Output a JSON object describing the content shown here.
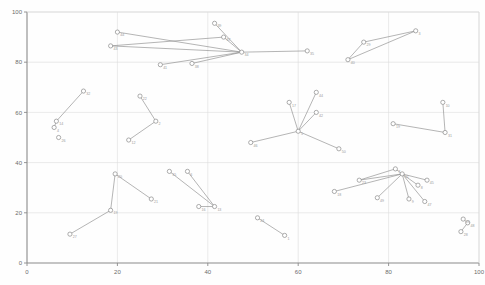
{
  "chart_data": {
    "type": "scatter",
    "title": "",
    "xlabel": "",
    "ylabel": "",
    "xlim": [
      0,
      100
    ],
    "ylim": [
      0,
      100
    ],
    "grid": true,
    "legend": "none",
    "xticks": [
      "0",
      "20",
      "40",
      "60",
      "80",
      "100"
    ],
    "yticks": [
      "0",
      "20",
      "40",
      "60",
      "80",
      "100"
    ],
    "xtick_values": [
      0,
      20,
      40,
      60,
      80,
      100
    ],
    "ytick_values": [
      0,
      20,
      40,
      60,
      80,
      100
    ],
    "node_color": "#ffffff",
    "node_stroke": "#8a8a8a",
    "edge_color": "#8d8d8d",
    "axis_color": "#8a8a8a",
    "grid_color": "#dcdcdc",
    "nodes": [
      {
        "id": "44",
        "label": "44",
        "x": 20.0,
        "y": 92.0
      },
      {
        "id": "43",
        "label": "43",
        "x": 18.5,
        "y": 86.5
      },
      {
        "id": "41",
        "label": "41",
        "x": 29.5,
        "y": 79.0
      },
      {
        "id": "38",
        "label": "38",
        "x": 36.5,
        "y": 79.5
      },
      {
        "id": "34",
        "label": "34",
        "x": 47.5,
        "y": 84.0
      },
      {
        "id": "39",
        "label": "39",
        "x": 41.5,
        "y": 95.5
      },
      {
        "id": "37",
        "label": "37",
        "x": 43.5,
        "y": 90.0
      },
      {
        "id": "35",
        "label": "35",
        "x": 62.0,
        "y": 84.5
      },
      {
        "id": "3",
        "label": "3",
        "x": 86.0,
        "y": 92.5
      },
      {
        "id": "29",
        "label": "29",
        "x": 74.5,
        "y": 88.0
      },
      {
        "id": "40",
        "label": "40",
        "x": 71.0,
        "y": 81.0
      },
      {
        "id": "32",
        "label": "32",
        "x": 12.5,
        "y": 68.5
      },
      {
        "id": "14",
        "label": "14",
        "x": 6.5,
        "y": 56.5
      },
      {
        "id": "4",
        "label": "4",
        "x": 6.0,
        "y": 54.0
      },
      {
        "id": "26",
        "label": "26",
        "x": 7.0,
        "y": 50.0
      },
      {
        "id": "22",
        "label": "22",
        "x": 25.0,
        "y": 66.5
      },
      {
        "id": "2",
        "label": "2",
        "x": 28.5,
        "y": 56.5
      },
      {
        "id": "12",
        "label": "12",
        "x": 22.5,
        "y": 49.0
      },
      {
        "id": "44b",
        "label": "44",
        "x": 64.0,
        "y": 68.0
      },
      {
        "id": "42",
        "label": "42",
        "x": 64.0,
        "y": 60.0
      },
      {
        "id": "17",
        "label": "17",
        "x": 58.0,
        "y": 64.0
      },
      {
        "id": "5",
        "label": "5",
        "x": 60.0,
        "y": 52.5
      },
      {
        "id": "46",
        "label": "46",
        "x": 49.5,
        "y": 48.0
      },
      {
        "id": "50",
        "label": "50",
        "x": 69.0,
        "y": 45.5
      },
      {
        "id": "19",
        "label": "19",
        "x": 81.0,
        "y": 55.5
      },
      {
        "id": "31",
        "label": "31",
        "x": 92.5,
        "y": 52.0
      },
      {
        "id": "10",
        "label": "10",
        "x": 92.0,
        "y": 64.0
      },
      {
        "id": "7",
        "label": "7",
        "x": 81.5,
        "y": 37.5
      },
      {
        "id": "11",
        "label": "11",
        "x": 83.0,
        "y": 35.5
      },
      {
        "id": "8",
        "label": "8",
        "x": 86.5,
        "y": 31.0
      },
      {
        "id": "45",
        "label": "45",
        "x": 88.5,
        "y": 33.0
      },
      {
        "id": "9",
        "label": "9",
        "x": 84.5,
        "y": 25.5
      },
      {
        "id": "47",
        "label": "47",
        "x": 88.0,
        "y": 24.5
      },
      {
        "id": "23",
        "label": "23",
        "x": 73.5,
        "y": 33.0
      },
      {
        "id": "18",
        "label": "18",
        "x": 68.0,
        "y": 28.5
      },
      {
        "id": "49",
        "label": "49",
        "x": 77.5,
        "y": 26.0
      },
      {
        "id": "15",
        "label": "15",
        "x": 31.5,
        "y": 36.5
      },
      {
        "id": "6",
        "label": "6",
        "x": 35.5,
        "y": 36.5
      },
      {
        "id": "16",
        "label": "16",
        "x": 38.0,
        "y": 22.5
      },
      {
        "id": "13",
        "label": "13",
        "x": 41.5,
        "y": 22.5
      },
      {
        "id": "20",
        "label": "20",
        "x": 19.5,
        "y": 35.5
      },
      {
        "id": "19b",
        "label": "19",
        "x": 18.5,
        "y": 21.0
      },
      {
        "id": "21",
        "label": "21",
        "x": 27.5,
        "y": 25.5
      },
      {
        "id": "27",
        "label": "27",
        "x": 9.5,
        "y": 11.5
      },
      {
        "id": "24",
        "label": "24",
        "x": 51.0,
        "y": 18.0
      },
      {
        "id": "1",
        "label": "1",
        "x": 57.0,
        "y": 11.0
      },
      {
        "id": "48",
        "label": "48",
        "x": 97.5,
        "y": 16.0
      },
      {
        "id": "25",
        "label": "25",
        "x": 96.5,
        "y": 17.5
      },
      {
        "id": "28",
        "label": "28",
        "x": 96.0,
        "y": 12.5
      }
    ],
    "edges": [
      {
        "source": "44",
        "target": "34"
      },
      {
        "source": "43",
        "target": "34"
      },
      {
        "source": "41",
        "target": "34"
      },
      {
        "source": "38",
        "target": "34"
      },
      {
        "source": "39",
        "target": "34"
      },
      {
        "source": "37",
        "target": "34"
      },
      {
        "source": "34",
        "target": "35"
      },
      {
        "source": "43",
        "target": "37"
      },
      {
        "source": "3",
        "target": "29"
      },
      {
        "source": "3",
        "target": "40"
      },
      {
        "source": "29",
        "target": "40"
      },
      {
        "source": "32",
        "target": "14"
      },
      {
        "source": "14",
        "target": "4"
      },
      {
        "source": "22",
        "target": "2"
      },
      {
        "source": "2",
        "target": "12"
      },
      {
        "source": "5",
        "target": "44b"
      },
      {
        "source": "5",
        "target": "42"
      },
      {
        "source": "5",
        "target": "17"
      },
      {
        "source": "5",
        "target": "46"
      },
      {
        "source": "5",
        "target": "50"
      },
      {
        "source": "19",
        "target": "31"
      },
      {
        "source": "10",
        "target": "31"
      },
      {
        "source": "11",
        "target": "7"
      },
      {
        "source": "11",
        "target": "8"
      },
      {
        "source": "11",
        "target": "45"
      },
      {
        "source": "11",
        "target": "9"
      },
      {
        "source": "11",
        "target": "47"
      },
      {
        "source": "11",
        "target": "23"
      },
      {
        "source": "11",
        "target": "18"
      },
      {
        "source": "11",
        "target": "49"
      },
      {
        "source": "23",
        "target": "7"
      },
      {
        "source": "13",
        "target": "15"
      },
      {
        "source": "13",
        "target": "6"
      },
      {
        "source": "13",
        "target": "16"
      },
      {
        "source": "20",
        "target": "19b"
      },
      {
        "source": "20",
        "target": "21"
      },
      {
        "source": "19b",
        "target": "27"
      },
      {
        "source": "24",
        "target": "1"
      },
      {
        "source": "48",
        "target": "25"
      },
      {
        "source": "48",
        "target": "28"
      }
    ]
  }
}
